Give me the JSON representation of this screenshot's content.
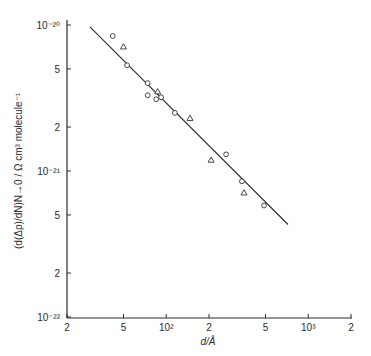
{
  "chart_data": {
    "type": "scatter",
    "title": "",
    "xlabel": "d/Å",
    "ylabel": "(d(Δρ)/dN)N→0 / Ω cm³ molecule⁻¹",
    "xscale": "log",
    "yscale": "log",
    "xlim": [
      20,
      2000
    ],
    "ylim": [
      1e-22,
      1e-20
    ],
    "grid": false,
    "legend": null,
    "x_ticks": [
      {
        "value": 20,
        "label": "2"
      },
      {
        "value": 50,
        "label": "5"
      },
      {
        "value": 100,
        "label": "10²"
      },
      {
        "value": 200,
        "label": "2"
      },
      {
        "value": 500,
        "label": "5"
      },
      {
        "value": 1000,
        "label": "10³"
      },
      {
        "value": 2000,
        "label": "2"
      }
    ],
    "y_ticks": [
      {
        "value": 1e-22,
        "label": "10⁻²²"
      },
      {
        "value": 2e-22,
        "label": "2"
      },
      {
        "value": 5e-22,
        "label": "5"
      },
      {
        "value": 1e-21,
        "label": "10⁻²¹"
      },
      {
        "value": 2e-21,
        "label": "2"
      },
      {
        "value": 5e-21,
        "label": "5"
      },
      {
        "value": 1e-20,
        "label": "10⁻²⁰"
      }
    ],
    "series": [
      {
        "name": "circles",
        "marker": "circle",
        "points": [
          {
            "x": 42,
            "y": 8.4e-21
          },
          {
            "x": 53,
            "y": 5.3e-21
          },
          {
            "x": 74,
            "y": 4e-21
          },
          {
            "x": 74,
            "y": 3.3e-21
          },
          {
            "x": 85,
            "y": 3.1e-21
          },
          {
            "x": 92,
            "y": 3.2e-21
          },
          {
            "x": 115,
            "y": 2.5e-21
          },
          {
            "x": 264,
            "y": 1.3e-21
          },
          {
            "x": 341,
            "y": 8.5e-22
          },
          {
            "x": 488,
            "y": 5.8e-22
          }
        ]
      },
      {
        "name": "triangles",
        "marker": "triangle",
        "points": [
          {
            "x": 50,
            "y": 7.1e-21
          },
          {
            "x": 87,
            "y": 3.5e-21
          },
          {
            "x": 147,
            "y": 2.3e-21
          },
          {
            "x": 207,
            "y": 1.19e-21
          },
          {
            "x": 353,
            "y": 7.1e-22
          }
        ]
      },
      {
        "name": "fit",
        "marker": "line",
        "points": [
          {
            "x": 29,
            "y": 9.7e-21
          },
          {
            "x": 720,
            "y": 4.3e-22
          }
        ]
      }
    ]
  }
}
